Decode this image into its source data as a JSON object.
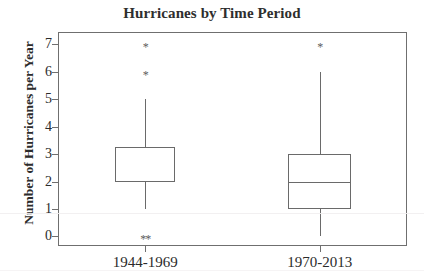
{
  "chart_data": {
    "type": "box",
    "title": "Hurricanes by Time Period",
    "xlabel": "",
    "ylabel": "Number of Hurricanes per Year",
    "ylim": [
      -0.35,
      7.45
    ],
    "yticks": [
      0,
      1,
      2,
      3,
      4,
      5,
      6,
      7
    ],
    "ytick_labels": [
      "0",
      "1",
      "2",
      "3",
      "4",
      "5",
      "6",
      "7"
    ],
    "categories": [
      "1944-1969",
      "1970-2013"
    ],
    "grid": false,
    "legend": null,
    "frame_color": "#6f6f6f",
    "box_color": "#6a6a6a",
    "box_fill": "#ffffff",
    "outlier_marker": "*",
    "boxes": [
      {
        "category": "1944-1969",
        "whisker_low": 1,
        "q1": 2,
        "median": 2,
        "q3": 3.25,
        "whisker_high": 5,
        "outliers": [
          0,
          0,
          6,
          7
        ],
        "median_on_edge": true
      },
      {
        "category": "1970-2013",
        "whisker_low": 0,
        "q1": 1,
        "median": 2,
        "q3": 3,
        "whisker_high": 6,
        "outliers": [
          7
        ],
        "median_on_edge": false
      }
    ],
    "outlier_labels": [
      {
        "box": 0,
        "value": 7,
        "glyph": "*"
      },
      {
        "box": 0,
        "value": 6,
        "glyph": "*"
      },
      {
        "box": 0,
        "value": 0,
        "glyph": "**"
      },
      {
        "box": 1,
        "value": 7,
        "glyph": "*"
      }
    ]
  }
}
